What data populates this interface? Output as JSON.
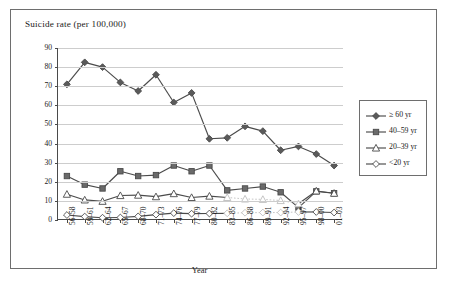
{
  "chart_data": {
    "type": "line",
    "title": "Suicide rate (per 100,000)",
    "xlabel": "Year",
    "ylabel": "",
    "ylim": [
      0,
      90
    ],
    "yticks": [
      0,
      10,
      20,
      30,
      40,
      50,
      60,
      70,
      80,
      90
    ],
    "grid": true,
    "legend_position": "right",
    "categories": [
      "56–58",
      "59–61",
      "62–64",
      "65–67",
      "68–70",
      "71–73",
      "74–76",
      "77–79",
      "80–82",
      "83–85",
      "86–88",
      "89–91",
      "92–94",
      "95–97",
      "98–00",
      "01–03"
    ],
    "series": [
      {
        "name": "≥ 60 yr",
        "marker": "filled-diamond",
        "color": "#5a5a5a",
        "values": [
          71.0,
          82.5,
          80.0,
          72.0,
          67.5,
          76.0,
          61.5,
          66.5,
          42.5,
          43.0,
          49.0,
          46.5,
          36.5,
          38.5,
          34.5,
          28.5
        ]
      },
      {
        "name": "40–59 yr",
        "marker": "filled-square",
        "color": "#6a6a6a",
        "values": [
          23.0,
          18.5,
          16.5,
          25.5,
          23.0,
          23.5,
          28.5,
          25.5,
          28.5,
          15.5,
          16.5,
          17.5,
          14.5,
          6.5,
          15.0,
          14.0
        ]
      },
      {
        "name": "20–39 yr",
        "marker": "open-triangle",
        "color": "#7a7a7a",
        "values": [
          13.5,
          10.5,
          9.8,
          12.8,
          13.0,
          12.2,
          13.8,
          11.8,
          12.5,
          11.8,
          11.0,
          10.8,
          10.2,
          8.5,
          15.2,
          14.0
        ],
        "faded_segment": [
          9,
          13
        ]
      },
      {
        "name": "<20 yr",
        "marker": "open-diamond",
        "color": "#7a7a7a",
        "values": [
          2.6,
          1.8,
          1.2,
          1.3,
          1.9,
          2.8,
          3.6,
          3.3,
          3.4,
          3.5,
          3.8,
          3.9,
          3.9,
          4.2,
          4.2,
          3.9
        ],
        "faded_segment": [
          9,
          13
        ]
      }
    ]
  },
  "legend": {
    "items": [
      {
        "label": "≥ 60 yr"
      },
      {
        "label": "40–59 yr"
      },
      {
        "label": "20–39 yr"
      },
      {
        "label": "<20 yr"
      }
    ]
  }
}
